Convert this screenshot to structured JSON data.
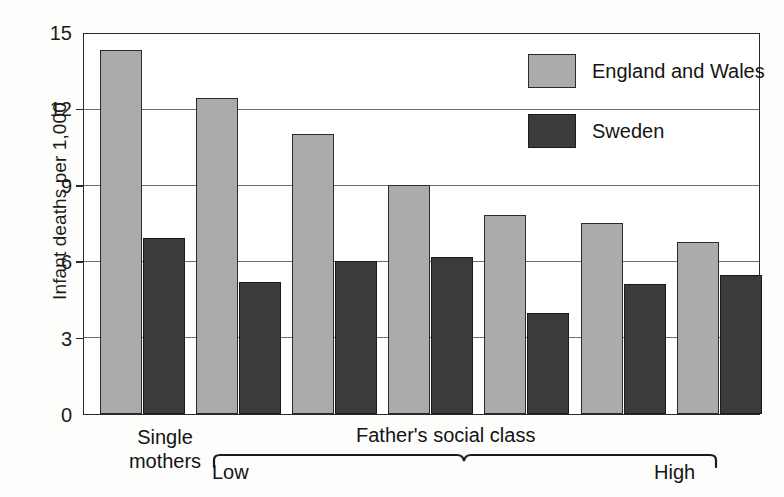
{
  "chart_data": {
    "type": "bar",
    "title": "",
    "xlabel": "Father's social class",
    "ylabel": "Infant deaths per 1,000",
    "ylim": [
      0,
      15
    ],
    "yticks": [
      0,
      3,
      6,
      9,
      12,
      15
    ],
    "ytick_labels": [
      "0",
      "3",
      "6",
      "9",
      "12",
      "15"
    ],
    "grid": true,
    "legend_position": "top-right",
    "categories": [
      "Single mothers",
      "Class 1 (Low)",
      "Class 2",
      "Class 3",
      "Class 4",
      "Class 5",
      "Class 6 (High)"
    ],
    "series": [
      {
        "name": "England and Wales",
        "color": "#ababab",
        "values": [
          14.3,
          12.4,
          11.0,
          9.0,
          7.8,
          7.5,
          6.75
        ]
      },
      {
        "name": "Sweden",
        "color": "#3b3b3b",
        "values": [
          6.9,
          5.2,
          6.0,
          6.15,
          3.95,
          5.1,
          5.45
        ]
      }
    ],
    "annotations": {
      "single_mothers_group": "Single\nmothers",
      "brace_label": "Father's social class",
      "brace_low_end": "Low",
      "brace_high_end": "High"
    }
  },
  "axis": {
    "y_title": "Infant deaths per 1,000",
    "ticks": [
      {
        "value": 15,
        "label": "15"
      },
      {
        "value": 12,
        "label": "12"
      },
      {
        "value": 9,
        "label": "9"
      },
      {
        "value": 6,
        "label": "6"
      },
      {
        "value": 3,
        "label": "3"
      },
      {
        "value": 0,
        "label": "0"
      }
    ]
  },
  "legend": {
    "items": [
      {
        "label": "England and Wales",
        "color": "#ababab",
        "key": "series-ew"
      },
      {
        "label": "Sweden",
        "color": "#3b3b3b",
        "key": "series-se"
      }
    ]
  },
  "x_axis": {
    "single_mothers_line1": "Single",
    "single_mothers_line2": "mothers",
    "low": "Low",
    "high": "High",
    "social_class": "Father's social class"
  },
  "colors": {
    "series_england_wales": "#ababab",
    "series_sweden": "#3b3b3b",
    "axis": "#2a2a2a",
    "gridline": "#6f6f6f",
    "background": "#fdfdfc"
  }
}
